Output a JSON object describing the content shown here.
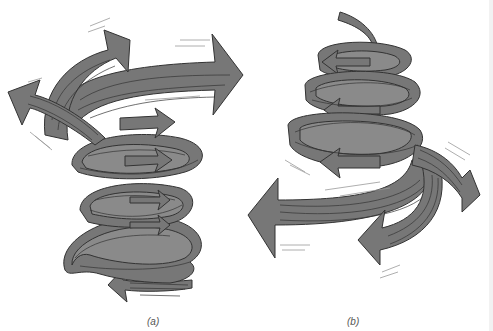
{
  "figure": {
    "colors": {
      "ribbon": "#777777",
      "outline": "#333333",
      "background": "#ffffff"
    },
    "panels": [
      {
        "id": "a",
        "label": "(a)",
        "shape": "helix widening upward (arrows spreading at top)"
      },
      {
        "id": "b",
        "label": "(b)",
        "shape": "helix widening downward (arrows spreading at bottom)"
      }
    ]
  }
}
